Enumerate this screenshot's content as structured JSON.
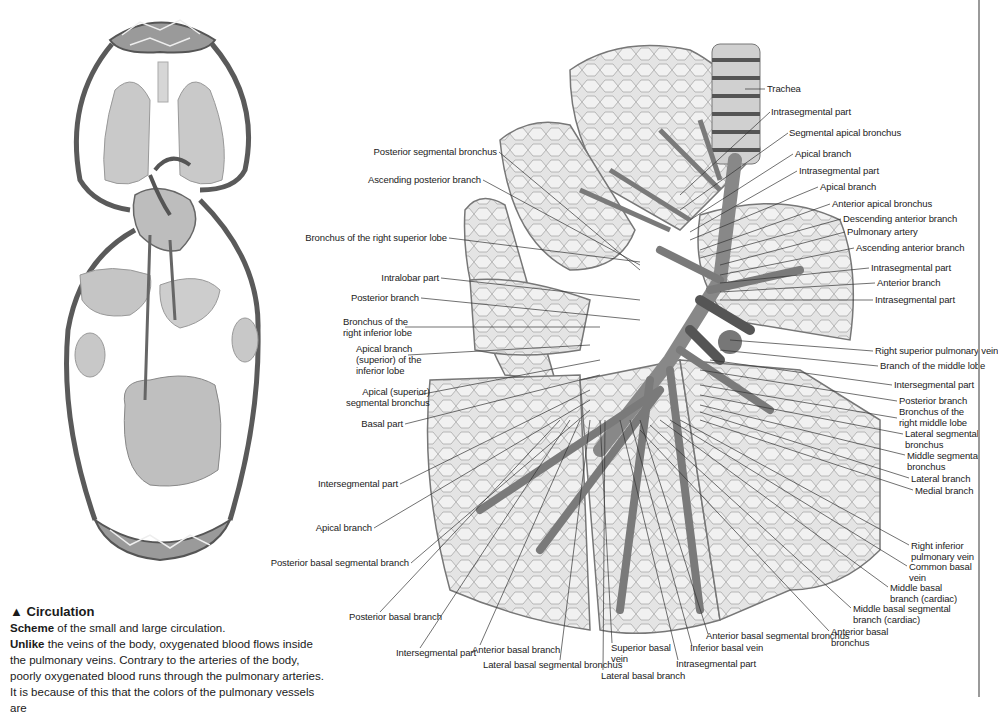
{
  "caption": {
    "title_icon": "▲",
    "title": "Circulation",
    "line1_bold": "Scheme",
    "line1_rest": " of the small and large circulation.",
    "para_bold": "Unlike",
    "para_rest": " the veins of the body, oxygenated blood flows inside the pulmonary veins. Contrary to the arteries of the body, poorly oxygenated blood runs through the pulmonary arteries. It is because of this that the colors of the pulmonary vessels are"
  },
  "figures": {
    "circulation": "circulation-scheme-illustration",
    "lung": "right-lung-bronchi-and-vessels-illustration"
  },
  "labels_right": [
    {
      "id": "trachea",
      "text": "Trachea",
      "x": 767,
      "y": 85
    },
    {
      "id": "intrasegmental-part-1",
      "text": "Intrasegmental part",
      "x": 771,
      "y": 108
    },
    {
      "id": "segmental-apical-bronchus",
      "text": "Segmental apical bronchus",
      "x": 789,
      "y": 129
    },
    {
      "id": "apical-branch-1",
      "text": "Apical branch",
      "x": 795,
      "y": 150
    },
    {
      "id": "intrasegmental-part-2",
      "text": "Intrasegmental part",
      "x": 799,
      "y": 167
    },
    {
      "id": "apical-branch-2",
      "text": "Apical branch",
      "x": 820,
      "y": 183
    },
    {
      "id": "anterior-apical-bronchus",
      "text": "Anterior apical bronchus",
      "x": 832,
      "y": 200
    },
    {
      "id": "descending-anterior-branch",
      "text": "Descending anterior branch",
      "x": 843,
      "y": 215
    },
    {
      "id": "pulmonary-artery",
      "text": "Pulmonary artery",
      "x": 847,
      "y": 228
    },
    {
      "id": "ascending-anterior-branch",
      "text": "Ascending anterior branch",
      "x": 856,
      "y": 244
    },
    {
      "id": "intrasegmental-part-3",
      "text": "Intrasegmental part",
      "x": 871,
      "y": 264
    },
    {
      "id": "anterior-branch",
      "text": "Anterior branch",
      "x": 877,
      "y": 279
    },
    {
      "id": "intrasegmental-part-4",
      "text": "Intrasegmental part",
      "x": 875,
      "y": 296
    },
    {
      "id": "right-superior-pulmonary-vein",
      "text": "Right superior pulmonary vein",
      "x": 875,
      "y": 347
    },
    {
      "id": "branch-of-middle-lobe",
      "text": "Branch of the middle lobe",
      "x": 880,
      "y": 362
    },
    {
      "id": "intersegmental-part-r",
      "text": "Intersegmental part",
      "x": 894,
      "y": 381
    },
    {
      "id": "posterior-branch-r",
      "text": "Posterior branch",
      "x": 899,
      "y": 397
    }
  ],
  "labels_right_multi": [
    {
      "id": "bronchus-right-middle-lobe",
      "lines": [
        "Bronchus of the",
        "right middle lobe"
      ],
      "x": 899,
      "y": 408
    },
    {
      "id": "lateral-segmental-bronchus",
      "lines": [
        "Lateral segmental",
        "bronchus"
      ],
      "x": 905,
      "y": 430
    },
    {
      "id": "middle-segmental-bronchus",
      "lines": [
        "Middle segmental",
        "bronchus"
      ],
      "x": 907,
      "y": 451
    },
    {
      "id": "lateral-branch",
      "lines": [
        "Lateral branch"
      ],
      "x": 911,
      "y": 474
    },
    {
      "id": "medial-branch",
      "lines": [
        "Medial branch"
      ],
      "x": 915,
      "y": 486
    },
    {
      "id": "right-inferior-pulmonary-vein",
      "lines": [
        "Right inferior",
        "pulmonary vein"
      ],
      "x": 911,
      "y": 541
    },
    {
      "id": "common-basal-vein",
      "lines": [
        "Common basal",
        "vein"
      ],
      "x": 909,
      "y": 562
    },
    {
      "id": "middle-basal-branch-cardiac",
      "lines": [
        "Middle basal",
        "branch (cardiac)"
      ],
      "x": 890,
      "y": 583
    },
    {
      "id": "middle-basal-segmental-branch",
      "lines": [
        "Middle basal segmental",
        "branch (cardiac)"
      ],
      "x": 853,
      "y": 604
    },
    {
      "id": "anterior-basal-bronchus",
      "lines": [
        "Anterior basal",
        "bronchus"
      ],
      "x": 831,
      "y": 627
    }
  ],
  "labels_left": [
    {
      "id": "posterior-segmental-bronchus",
      "lines": [
        "Posterior segmental bronchus"
      ],
      "right": 497,
      "y": 148
    },
    {
      "id": "ascending-posterior-branch",
      "lines": [
        "Ascending posterior branch"
      ],
      "right": 481,
      "y": 176
    },
    {
      "id": "bronchus-right-superior-lobe",
      "lines": [
        "Bronchus of the right superior lobe"
      ],
      "right": 447,
      "y": 234
    },
    {
      "id": "intralobar-part",
      "lines": [
        "Intralobar part"
      ],
      "right": 439,
      "y": 274
    },
    {
      "id": "posterior-branch-l",
      "lines": [
        "Posterior branch"
      ],
      "right": 419,
      "y": 294
    },
    {
      "id": "bronchus-right-inferior-lobe",
      "lines": [
        "Bronchus of the",
        "right inferior lobe"
      ],
      "left": 343,
      "y": 318
    },
    {
      "id": "apical-branch-superior",
      "lines": [
        "Apical branch",
        "(superior) of the",
        "inferior lobe"
      ],
      "left": 356,
      "y": 345
    },
    {
      "id": "apical-superior-segmental-bronchus",
      "lines": [
        "Apical (superior)",
        "segmental bronchus"
      ],
      "left": 346,
      "y": 388
    },
    {
      "id": "basal-part",
      "lines": [
        "Basal part"
      ],
      "right": 403,
      "y": 420
    },
    {
      "id": "intersegmental-part-l",
      "lines": [
        "Intersegmental part"
      ],
      "right": 398,
      "y": 480
    },
    {
      "id": "apical-branch-l",
      "lines": [
        "Apical branch"
      ],
      "right": 372,
      "y": 524
    },
    {
      "id": "posterior-basal-segmental-branch",
      "lines": [
        "Posterior basal segmental branch"
      ],
      "right": 409,
      "y": 559
    }
  ],
  "labels_bottom": [
    {
      "id": "posterior-basal-branch",
      "lines": [
        "Posterior basal branch"
      ],
      "x": 349,
      "y": 611
    },
    {
      "id": "intersegmental-part-b",
      "lines": [
        "Intersegmental part"
      ],
      "x": 396,
      "y": 647
    },
    {
      "id": "anterior-basal-branch",
      "lines": [
        "Anterior basal branch"
      ],
      "x": 472,
      "y": 644
    },
    {
      "id": "lateral-basal-segmental-bronchus",
      "lines": [
        "Lateral basal segmental bronchus"
      ],
      "x": 483,
      "y": 659
    },
    {
      "id": "superior-basal-vein",
      "lines": [
        "Superior basal",
        "vein"
      ],
      "x": 611,
      "y": 643
    },
    {
      "id": "lateral-basal-branch",
      "lines": [
        "Lateral basal branch"
      ],
      "x": 601,
      "y": 670
    },
    {
      "id": "intrasegmental-part-b",
      "lines": [
        "Intrasegmental part"
      ],
      "x": 676,
      "y": 660
    },
    {
      "id": "inferior-basal-vein",
      "lines": [
        "Inferior basal vein"
      ],
      "x": 690,
      "y": 643
    },
    {
      "id": "anterior-basal-segmental-bronchus",
      "lines": [
        "Anterior basal segmental bronchus"
      ],
      "x": 706,
      "y": 632
    }
  ]
}
